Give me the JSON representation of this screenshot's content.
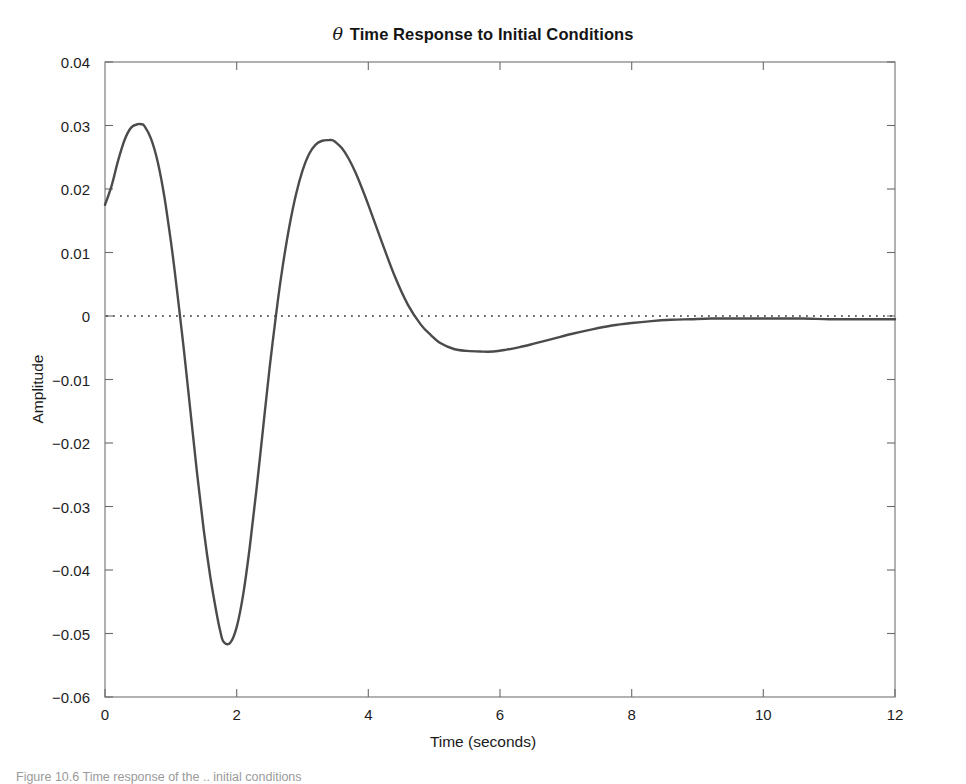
{
  "figure": {
    "background_color": "#ffffff",
    "caption_partial": "Figure 10.6 Time response of the .. initial conditions"
  },
  "chart_data": {
    "type": "line",
    "title": "θ Time Response to Initial Conditions",
    "title_prefix_symbol": "θ",
    "title_rest": " Time Response to Initial Conditions",
    "xlabel": "Time (seconds)",
    "ylabel": "Amplitude",
    "xlim": [
      0,
      12
    ],
    "ylim": [
      -0.06,
      0.04
    ],
    "xticks": [
      0,
      2,
      4,
      6,
      8,
      10,
      12
    ],
    "xtick_labels": [
      "0",
      "2",
      "4",
      "6",
      "8",
      "10",
      "12"
    ],
    "yticks": [
      0.04,
      0.03,
      0.02,
      0.01,
      0,
      -0.01,
      -0.02,
      -0.03,
      -0.04,
      -0.05,
      -0.06
    ],
    "ytick_labels": [
      "0.04",
      "0.03",
      "0.02",
      "0.01",
      "0",
      "−0.01",
      "−0.02",
      "−0.03",
      "−0.04",
      "−0.05",
      "−0.06"
    ],
    "grid": false,
    "legend": null,
    "zero_reference_line": {
      "value": 0,
      "style": "dotted",
      "color": "#3a3a3a"
    },
    "series": [
      {
        "name": "theta response",
        "color": "#4b4b4b",
        "line_width": 2.4,
        "annotations": {
          "initial_value": 0.0175,
          "first_peak": {
            "x": 0.55,
            "y": 0.0302
          },
          "first_zero_crossing": {
            "x": 1.05,
            "y": 0
          },
          "global_min": {
            "x": 1.75,
            "y": -0.0517
          },
          "second_zero_crossing": {
            "x": 2.62,
            "y": 0
          },
          "second_peak": {
            "x": 3.45,
            "y": 0.0277
          },
          "third_zero_crossing": {
            "x": 4.95,
            "y": 0
          },
          "second_trough": {
            "x": 5.9,
            "y": -0.0056
          },
          "settling_value": -0.0005
        },
        "x": [
          0,
          0.1,
          0.2,
          0.3,
          0.4,
          0.5,
          0.55,
          0.6,
          0.7,
          0.8,
          0.9,
          1.0,
          1.05,
          1.1,
          1.2,
          1.3,
          1.4,
          1.5,
          1.6,
          1.7,
          1.75,
          1.8,
          1.9,
          2.0,
          2.1,
          2.2,
          2.3,
          2.4,
          2.5,
          2.62,
          2.7,
          2.8,
          2.9,
          3.0,
          3.1,
          3.2,
          3.3,
          3.4,
          3.45,
          3.5,
          3.6,
          3.7,
          3.8,
          3.9,
          4.0,
          4.2,
          4.4,
          4.6,
          4.8,
          4.95,
          5.1,
          5.3,
          5.5,
          5.7,
          5.9,
          6.1,
          6.3,
          6.5,
          6.8,
          7.1,
          7.4,
          7.7,
          8.0,
          8.3,
          8.6,
          8.9,
          9.2,
          9.5,
          9.8,
          10.2,
          10.6,
          11.0,
          11.4,
          11.7,
          12.0
        ],
        "y": [
          0.0175,
          0.0205,
          0.0245,
          0.0278,
          0.0297,
          0.0302,
          0.0302,
          0.0299,
          0.0279,
          0.0243,
          0.0189,
          0.0118,
          0.0078,
          0.0035,
          -0.0055,
          -0.0152,
          -0.0249,
          -0.0337,
          -0.0411,
          -0.0471,
          -0.0496,
          -0.0513,
          -0.0515,
          -0.049,
          -0.0438,
          -0.0363,
          -0.0274,
          -0.0178,
          -0.0082,
          0.002,
          0.0079,
          0.0141,
          0.0191,
          0.0229,
          0.0255,
          0.027,
          0.0276,
          0.0277,
          0.0277,
          0.0274,
          0.0264,
          0.0248,
          0.0227,
          0.0202,
          0.0175,
          0.0118,
          0.0063,
          0.0018,
          -0.0014,
          -0.003,
          -0.0043,
          -0.0052,
          -0.0055,
          -0.0056,
          -0.0056,
          -0.0053,
          -0.0049,
          -0.0044,
          -0.0036,
          -0.0028,
          -0.0021,
          -0.0015,
          -0.0011,
          -0.0008,
          -0.0006,
          -0.0005,
          -0.0004,
          -0.0004,
          -0.0004,
          -0.0004,
          -0.0004,
          -0.0005,
          -0.0005,
          -0.0005,
          -0.0005
        ]
      }
    ]
  }
}
